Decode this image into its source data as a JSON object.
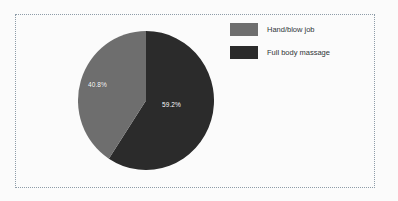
{
  "chart_data": {
    "type": "pie",
    "title": "",
    "categories": [
      "Hand/blow job",
      "Full body massage"
    ],
    "values": [
      40.8,
      59.2
    ],
    "value_labels": [
      "40.8%",
      "59.2%"
    ],
    "unit": "%",
    "colors": [
      "#6e6e6e",
      "#2b2b2b"
    ],
    "legend_position": "right",
    "grid": false,
    "start_angle_deg": 0,
    "direction": "clockwise",
    "slices": [
      {
        "name": "Full body massage",
        "value": 59.2,
        "label": "59.2%",
        "color": "#2b2b2b",
        "start_deg": 0,
        "end_deg": 213.12
      },
      {
        "name": "Hand/blow job",
        "value": 40.8,
        "label": "40.8%",
        "color": "#6e6e6e",
        "start_deg": 213.12,
        "end_deg": 360
      }
    ]
  },
  "frame": {
    "border_color": "#8e9ca8",
    "background": "#fbfbfb"
  },
  "legend": {
    "items": [
      {
        "label": "Hand/blow job",
        "color": "#6e6e6e"
      },
      {
        "label": "Full body massage",
        "color": "#2b2b2b"
      }
    ]
  },
  "labels": {
    "light_slice": "40.8%",
    "dark_slice": "59.2%"
  }
}
